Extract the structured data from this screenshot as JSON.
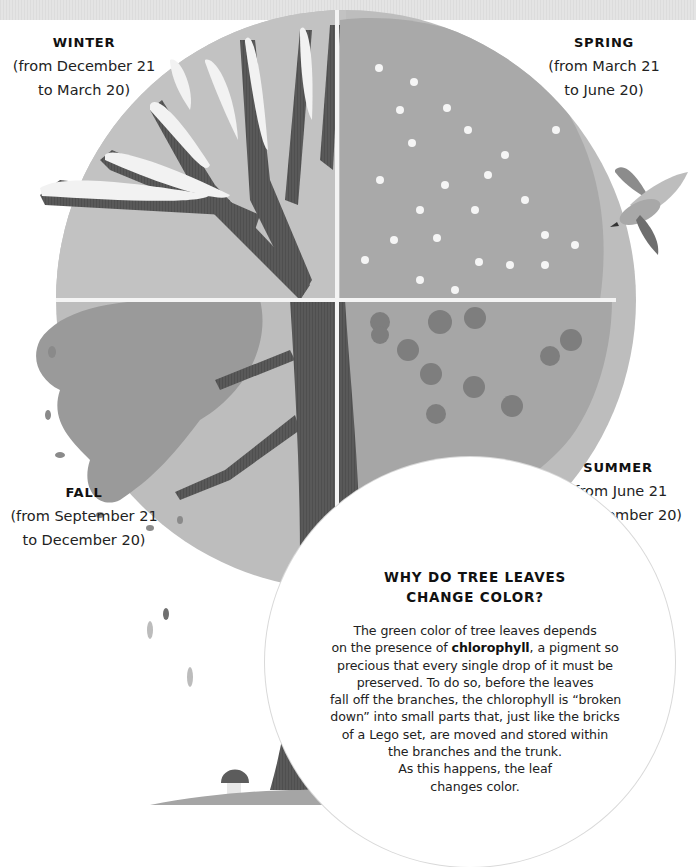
{
  "page": {
    "colors": {
      "background": "#ffffff",
      "top_band": "#e0e0e0",
      "circle_fill": "#bdbdbd",
      "trunk": "#5a5a5a",
      "divider": "#f4f4f4",
      "text": "#1a1a1a"
    }
  },
  "seasons": {
    "winter": {
      "title": "WINTER",
      "range_line1": "(from December 21",
      "range_line2": "to March 20)"
    },
    "spring": {
      "title": "SPRING",
      "range_line1": "(from March 21",
      "range_line2": "to June 20)"
    },
    "summer": {
      "title": "SUMMER",
      "range_line1": "(from June 21",
      "range_line2": "to September 20)"
    },
    "fall": {
      "title": "FALL",
      "range_line1": "(from September 21",
      "range_line2": "to December 20)"
    }
  },
  "info": {
    "title_line1": "WHY DO TREE LEAVES",
    "title_line2": "CHANGE COLOR?",
    "body": {
      "l1": "The green color of tree leaves depends",
      "l2_pre": "on the presence of ",
      "l2_bold": "chlorophyll",
      "l2_post": ", a pigment so",
      "l3": "precious that every single drop of it must be",
      "l4": "preserved. To do so, before the leaves",
      "l5": "fall off the branches, the chlorophyll is “broken",
      "l6": "down” into small parts that, just like the bricks",
      "l7": "of a Lego set, are moved and stored within",
      "l8": "the branches and the trunk.",
      "l9": "As this happens, the leaf",
      "l10": "changes color."
    }
  },
  "illustration": {
    "elements": [
      "tree-trunk",
      "winter-snowy-branches",
      "spring-blossoms",
      "summer-foliage-with-apples",
      "fall-foliage",
      "flying-bird",
      "falling-leaves",
      "mushroom",
      "grass-ground"
    ]
  }
}
